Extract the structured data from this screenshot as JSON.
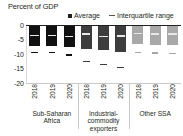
{
  "chart_data": {
    "type": "bar",
    "title": "Percent of GDP",
    "xlabel": "",
    "ylabel": "",
    "ylim": [
      -20,
      0
    ],
    "yticks": [
      0,
      -5,
      -10,
      -15,
      -20
    ],
    "ytick_labels": [
      "0",
      "-5",
      "-10",
      "-15",
      "-20"
    ],
    "grid": false,
    "legend_position": "top",
    "legend": [
      {
        "marker": "square",
        "label": "Average"
      },
      {
        "marker": "dash",
        "label": "Interquartile range"
      }
    ],
    "categories": [
      "2018",
      "2019",
      "2020",
      "2018",
      "2019",
      "2020",
      "2018",
      "2019",
      "2020"
    ],
    "groups": [
      {
        "label": "Sub-Saharan Africa",
        "color": "#111111",
        "years": [
          "2018",
          "2019",
          "2020"
        ],
        "iqr_top": [
          -0.4,
          -0.4,
          -0.3
        ],
        "iqr_bottom": [
          -7.2,
          -7.2,
          -7.6
        ],
        "average": [
          -3.6,
          -3.6,
          -4.0
        ],
        "lower_marker": [
          -9.4,
          -9.6,
          -10.3
        ]
      },
      {
        "label": "Industrial-commodity exporters",
        "color": "#3d3d3d",
        "years": [
          "2018",
          "2019",
          "2020"
        ],
        "iqr_top": [
          -0.4,
          -0.5,
          -0.3
        ],
        "iqr_bottom": [
          -8.2,
          -8.6,
          -9.2
        ],
        "average": [
          -3.2,
          -4.0,
          -3.7
        ],
        "lower_marker": [
          -12.6,
          -13.6,
          -14.6
        ]
      },
      {
        "label": "Other SSA",
        "color": "#a8a8a8",
        "years": [
          "2018",
          "2019",
          "2020"
        ],
        "iqr_top": [
          -0.4,
          -0.4,
          -0.4
        ],
        "iqr_bottom": [
          -6.6,
          -6.8,
          -7.0
        ],
        "average": [
          -3.0,
          -3.1,
          -3.2
        ],
        "lower_marker": [
          -9.5,
          -9.7,
          -9.9
        ]
      }
    ]
  },
  "colors": {
    "axis": "#231f20",
    "separator": "#c9c9c9",
    "average_marker": "#e8e8e8",
    "background": "#ffffff"
  }
}
